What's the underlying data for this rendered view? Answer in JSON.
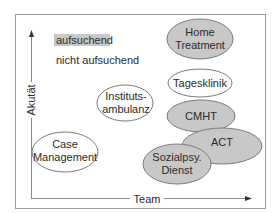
{
  "diagram": {
    "y_axis": {
      "label": "Akutät"
    },
    "x_axis": {
      "label": "Team"
    },
    "legend": [
      {
        "label": "aufsuchend",
        "style": "filled",
        "color": "#c8c8c8"
      },
      {
        "label": "nicht aufsuchend",
        "style": "plain"
      }
    ],
    "colors": {
      "frame": "#9a9a9a",
      "axis": "#8a8a8a",
      "filled": "#c8c8c8",
      "unfilled": "#ffffff",
      "outline": "#7a7a7a",
      "text": "#2a2a2a"
    },
    "nodes": [
      {
        "id": "home-treatment",
        "lines": [
          "Home",
          "Treatment"
        ],
        "filled": true
      },
      {
        "id": "tagesklinik",
        "lines": [
          "Tagesklinik"
        ],
        "filled": false
      },
      {
        "id": "institutsambulanz",
        "lines": [
          "Instituts-",
          "ambulanz"
        ],
        "filled": false
      },
      {
        "id": "cmht",
        "lines": [
          "CMHT"
        ],
        "filled": true
      },
      {
        "id": "act",
        "lines": [
          "ACT"
        ],
        "filled": true
      },
      {
        "id": "sozialpsy-dienst",
        "lines": [
          "Sozialpsy.",
          "Dienst"
        ],
        "filled": true
      },
      {
        "id": "case-management",
        "lines": [
          "Case",
          "Management"
        ],
        "filled": false
      }
    ]
  }
}
